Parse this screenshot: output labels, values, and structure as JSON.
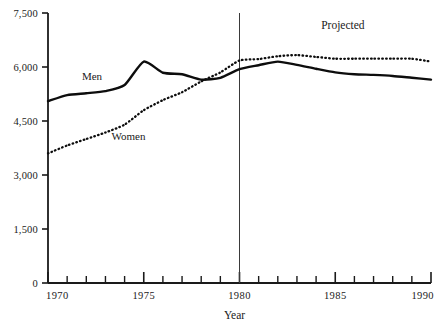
{
  "chart_data": {
    "type": "line",
    "title": "",
    "xlabel": "Year",
    "ylabel": "",
    "xlim": [
      1970,
      1990
    ],
    "ylim": [
      0,
      7500
    ],
    "grid": false,
    "legend_position": "inline-labels",
    "y_ticks": [
      0,
      1500,
      3000,
      4500,
      6000,
      7500
    ],
    "y_tick_labels": [
      "0",
      "1,500",
      "3,000",
      "4,500",
      "6,000",
      "7,500"
    ],
    "x_ticks": [
      1970,
      1971,
      1972,
      1973,
      1974,
      1975,
      1976,
      1977,
      1978,
      1979,
      1980,
      1981,
      1982,
      1983,
      1984,
      1985,
      1986,
      1987,
      1988,
      1989,
      1990
    ],
    "x_tick_labels_shown": [
      "1970",
      "1975",
      "1980",
      "1985",
      "1990"
    ],
    "x": [
      1970,
      1971,
      1972,
      1973,
      1974,
      1975,
      1976,
      1977,
      1978,
      1979,
      1980,
      1981,
      1982,
      1983,
      1984,
      1985,
      1986,
      1987,
      1988,
      1989,
      1990
    ],
    "series": [
      {
        "name": "Men",
        "style": "solid",
        "values": [
          5050,
          5220,
          5270,
          5330,
          5500,
          6150,
          5840,
          5800,
          5650,
          5700,
          5940,
          6050,
          6150,
          6060,
          5950,
          5850,
          5800,
          5780,
          5750,
          5700,
          5650
        ]
      },
      {
        "name": "Women",
        "style": "dotted",
        "values": [
          3600,
          3820,
          4000,
          4180,
          4400,
          4800,
          5080,
          5300,
          5600,
          5850,
          6180,
          6220,
          6300,
          6330,
          6280,
          6230,
          6230,
          6230,
          6230,
          6230,
          6150
        ]
      }
    ],
    "annotations": [
      {
        "name": "projected-label",
        "text": "Projected",
        "x": 1985.4,
        "y": 7060
      },
      {
        "name": "men-label",
        "text": "Men",
        "x": 1972.3,
        "y": 5640
      },
      {
        "name": "women-label",
        "text": "Women",
        "x": 1974.2,
        "y": 3980
      }
    ],
    "divider": {
      "name": "projection-divider",
      "x": 1980,
      "label": "Projected"
    }
  },
  "axes": {
    "x_title": "Year"
  }
}
